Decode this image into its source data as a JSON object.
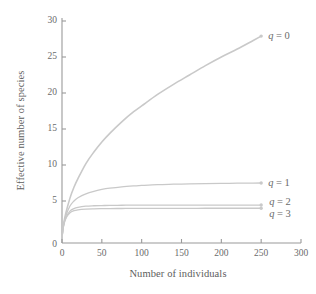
{
  "chart_data": {
    "type": "line",
    "title": "",
    "subtitle": "",
    "xlabel": "Number of individuals",
    "ylabel": "Effective number of species",
    "xlim": [
      0,
      300
    ],
    "ylim": [
      0,
      30
    ],
    "xticks": [
      0,
      50,
      100,
      150,
      200,
      250,
      300
    ],
    "yticks": [
      0,
      5,
      10,
      15,
      20,
      25,
      30
    ],
    "xtick_labels": [
      "0",
      "50",
      "100",
      "150",
      "200",
      "250",
      "300"
    ],
    "ytick_labels": [
      "0",
      "5",
      "10",
      "15",
      "20",
      "25",
      "30"
    ],
    "grid": false,
    "legend_position": "inline-right-end-of-curve",
    "line_color": "#c9c9c9",
    "axis_color": "#8e8e8e",
    "text_color": "#6b6b6b",
    "series": [
      {
        "name": "q = 0",
        "label_q": "q",
        "label_rest": " = 0",
        "endpoint_marker": true,
        "x": [
          0,
          2,
          5,
          10,
          15,
          20,
          30,
          40,
          50,
          60,
          75,
          90,
          100,
          120,
          140,
          160,
          180,
          200,
          220,
          240,
          250
        ],
        "values": [
          0,
          1.8,
          3.4,
          5.4,
          6.9,
          8.1,
          10.2,
          11.8,
          13.2,
          14.4,
          16.0,
          17.4,
          18.2,
          19.8,
          21.2,
          22.5,
          23.8,
          25.0,
          26.1,
          27.3,
          27.9
        ]
      },
      {
        "name": "q = 1",
        "label_q": "q",
        "label_rest": " = 1",
        "endpoint_marker": true,
        "x": [
          0,
          2,
          5,
          10,
          15,
          20,
          30,
          40,
          50,
          60,
          75,
          90,
          100,
          120,
          140,
          160,
          180,
          200,
          220,
          240,
          250
        ],
        "values": [
          0,
          1.7,
          3.0,
          4.3,
          5.0,
          5.45,
          6.0,
          6.35,
          6.6,
          6.78,
          6.97,
          7.1,
          7.16,
          7.27,
          7.33,
          7.38,
          7.42,
          7.45,
          7.47,
          7.49,
          7.5
        ]
      },
      {
        "name": "q = 2",
        "label_q": "q",
        "label_rest": " = 2",
        "endpoint_marker": true,
        "x": [
          0,
          2,
          5,
          10,
          15,
          20,
          30,
          40,
          50,
          60,
          75,
          90,
          100,
          120,
          140,
          160,
          180,
          200,
          220,
          240,
          250
        ],
        "values": [
          0,
          1.6,
          2.7,
          3.6,
          3.95,
          4.12,
          4.28,
          4.34,
          4.37,
          4.39,
          4.41,
          4.42,
          4.42,
          4.43,
          4.43,
          4.44,
          4.44,
          4.44,
          4.44,
          4.44,
          4.44
        ]
      },
      {
        "name": "q = 3",
        "label_q": "q",
        "label_rest": " = 3",
        "endpoint_marker": true,
        "x": [
          0,
          2,
          5,
          10,
          15,
          20,
          30,
          40,
          50,
          60,
          75,
          90,
          100,
          120,
          140,
          160,
          180,
          200,
          220,
          240,
          250
        ],
        "values": [
          0,
          1.55,
          2.6,
          3.35,
          3.65,
          3.78,
          3.88,
          3.92,
          3.94,
          3.95,
          3.96,
          3.97,
          3.97,
          3.98,
          3.98,
          3.98,
          3.99,
          3.99,
          3.99,
          3.99,
          3.99
        ]
      }
    ]
  },
  "axes": {
    "x_title": "Number of individuals",
    "y_title": "Effective number of species"
  },
  "x_ticks": [
    {
      "value": 0,
      "label": "0"
    },
    {
      "value": 50,
      "label": "50"
    },
    {
      "value": 100,
      "label": "100"
    },
    {
      "value": 150,
      "label": "150"
    },
    {
      "value": 200,
      "label": "200"
    },
    {
      "value": 250,
      "label": "250"
    },
    {
      "value": 300,
      "label": "300"
    }
  ],
  "y_ticks": [
    {
      "value": 0,
      "label": "0"
    },
    {
      "value": 5,
      "label": "5"
    },
    {
      "value": 10,
      "label": "10"
    },
    {
      "value": 15,
      "label": "15"
    },
    {
      "value": 20,
      "label": "20"
    },
    {
      "value": 25,
      "label": "25"
    },
    {
      "value": 30,
      "label": "30"
    }
  ],
  "curve_labels": [
    {
      "q": "q",
      "rest": " = 0"
    },
    {
      "q": "q",
      "rest": " = 1"
    },
    {
      "q": "q",
      "rest": " = 2"
    },
    {
      "q": "q",
      "rest": " = 3"
    }
  ]
}
